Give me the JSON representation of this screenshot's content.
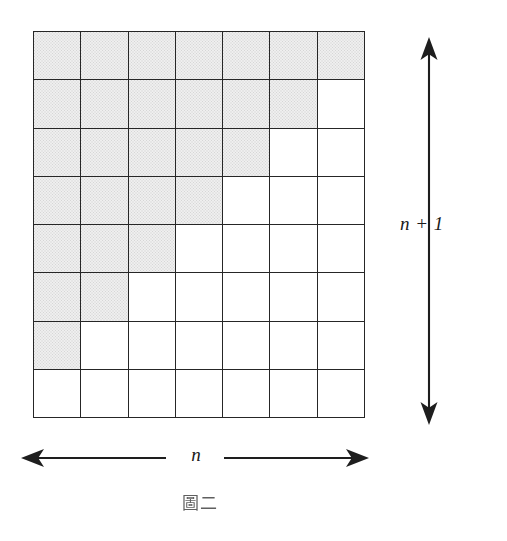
{
  "figure": {
    "caption": "圖二",
    "vertical_label": "n + 1",
    "horizontal_label": "n"
  },
  "chart_data": {
    "type": "heatmap",
    "title": "圖二",
    "xlabel": "n",
    "ylabel": "n + 1",
    "columns": 7,
    "rows": 8,
    "grid_width_cells": 7,
    "grid_height_cells": 8,
    "shaded_counts_per_row": [
      7,
      6,
      5,
      4,
      3,
      2,
      1,
      0
    ],
    "total_shaded_cells": 28,
    "total_cells": 56,
    "cells": [
      [
        1,
        1,
        1,
        1,
        1,
        1,
        1
      ],
      [
        1,
        1,
        1,
        1,
        1,
        1,
        0
      ],
      [
        1,
        1,
        1,
        1,
        1,
        0,
        0
      ],
      [
        1,
        1,
        1,
        1,
        0,
        0,
        0
      ],
      [
        1,
        1,
        1,
        0,
        0,
        0,
        0
      ],
      [
        1,
        1,
        0,
        0,
        0,
        0,
        0
      ],
      [
        1,
        0,
        0,
        0,
        0,
        0,
        0
      ],
      [
        0,
        0,
        0,
        0,
        0,
        0,
        0
      ]
    ],
    "colors": {
      "shaded": "#efefef",
      "unshaded": "#ffffff",
      "line": "#262626"
    },
    "grid": true,
    "legend": "none"
  }
}
